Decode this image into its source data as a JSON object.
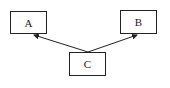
{
  "diagram": {
    "nodes": [
      {
        "id": "A",
        "label": "A"
      },
      {
        "id": "B",
        "label": "B"
      },
      {
        "id": "C",
        "label": "C"
      }
    ],
    "edges": [
      {
        "from": "C",
        "to": "A",
        "directed": true
      },
      {
        "from": "C",
        "to": "B",
        "directed": true
      }
    ]
  }
}
